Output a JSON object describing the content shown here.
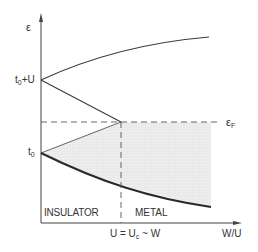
{
  "diagram": {
    "y_axis_label": "ε",
    "x_axis_label": "W/U",
    "level_top": {
      "base": "t",
      "sub": "0",
      "suffix": "+U"
    },
    "level_bottom": {
      "base": "t",
      "sub": "0"
    },
    "fermi_label": {
      "base": "ε",
      "sub": "F"
    },
    "critical_label": {
      "prefix": "U = U",
      "sub": "c",
      "suffix": " ~ W"
    },
    "region_left": "INSULATOR",
    "region_right": "METAL",
    "colors": {
      "line": "#3a3a3a",
      "bold_line": "#2a2a2a",
      "shade": "#e6e6e6",
      "dash": "#555555"
    }
  }
}
